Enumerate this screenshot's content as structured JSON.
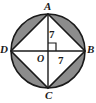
{
  "figure": {
    "kind": "circle-with-inscribed-square",
    "background_color": "#ffffff",
    "stroke_color": "#1a1a1a",
    "segment_fill_color": "#8c8c8c",
    "interior_fill_color": "#ffffff",
    "center": {
      "x": 48,
      "y": 51
    },
    "radius": 37,
    "vertices": {
      "A": {
        "label": "A",
        "x": 48,
        "y": 14,
        "position": "top"
      },
      "B": {
        "label": "B",
        "x": 85,
        "y": 51,
        "position": "right"
      },
      "C": {
        "label": "C",
        "x": 48,
        "y": 88,
        "position": "bottom"
      },
      "D": {
        "label": "D",
        "x": 11,
        "y": 51,
        "position": "left"
      }
    },
    "center_label": "O",
    "measures": [
      {
        "name": "radius-OA",
        "label": "7",
        "segment": "O to A",
        "orientation": "vertical"
      },
      {
        "name": "radius-OB",
        "label": "7",
        "segment": "O to B",
        "orientation": "horizontal"
      }
    ],
    "right_angle_marker": {
      "present": true,
      "at": "O",
      "quadrant": "upper-right",
      "size": 8
    },
    "shaded_regions": "four circular segments between square sides and circle"
  }
}
